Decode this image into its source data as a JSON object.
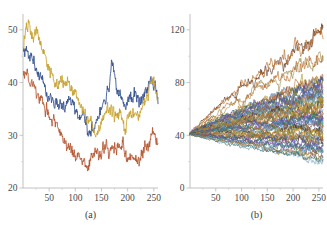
{
  "figure": {
    "background": "#ffffff",
    "axis_color": "#b9b9b9",
    "text_color": "#3a3a3a"
  },
  "chart_data": [
    {
      "type": "line",
      "panel_label": "(a)",
      "title": "",
      "xlabel": "",
      "ylabel": "",
      "xlim": [
        0,
        258
      ],
      "ylim": [
        20,
        53
      ],
      "xticks": [
        50,
        100,
        150,
        200,
        250
      ],
      "xtick_labels": [
        "50",
        "100",
        "150",
        "200",
        "250"
      ],
      "yticks": [
        20,
        30,
        40,
        50
      ],
      "ytick_labels": [
        "20",
        "30",
        "40",
        "50"
      ],
      "grid": false,
      "legend": "none",
      "n_series": 3,
      "series": [
        {
          "name": "path-1",
          "color": "#2F4D8F",
          "x": [
            1,
            5,
            10,
            15,
            20,
            25,
            30,
            35,
            40,
            45,
            50,
            55,
            60,
            65,
            70,
            75,
            80,
            85,
            90,
            95,
            100,
            105,
            110,
            115,
            120,
            125,
            130,
            135,
            140,
            145,
            150,
            155,
            160,
            165,
            170,
            175,
            180,
            185,
            190,
            195,
            200,
            205,
            210,
            215,
            220,
            225,
            230,
            235,
            240,
            245,
            250,
            255,
            258
          ],
          "values": [
            46.0,
            46.8,
            45.2,
            44.6,
            43.4,
            42.6,
            41.4,
            40.5,
            39.8,
            38.6,
            37.2,
            36.6,
            36.2,
            36.4,
            35.4,
            35.8,
            36.0,
            36.6,
            36.2,
            35.6,
            34.6,
            34.0,
            33.6,
            33.2,
            32.0,
            30.4,
            30.2,
            31.4,
            32.6,
            33.8,
            34.6,
            36.8,
            37.0,
            39.2,
            45.2,
            42.0,
            38.8,
            38.0,
            36.8,
            35.6,
            36.4,
            36.2,
            37.4,
            37.8,
            37.2,
            36.6,
            37.6,
            38.4,
            39.6,
            40.8,
            40.4,
            38.0,
            37.2
          ]
        },
        {
          "name": "path-2",
          "color": "#C6A12B",
          "x": [
            1,
            5,
            10,
            15,
            20,
            25,
            30,
            35,
            40,
            45,
            50,
            55,
            60,
            65,
            70,
            75,
            80,
            85,
            90,
            95,
            100,
            105,
            110,
            115,
            120,
            125,
            130,
            135,
            140,
            145,
            150,
            155,
            160,
            165,
            170,
            175,
            180,
            185,
            190,
            195,
            200,
            205,
            210,
            215,
            220,
            225,
            230,
            235,
            240,
            245,
            250,
            255,
            258
          ],
          "values": [
            46.4,
            50.0,
            51.6,
            49.6,
            48.6,
            49.6,
            48.4,
            47.0,
            45.8,
            44.2,
            42.8,
            41.8,
            40.0,
            39.2,
            39.8,
            40.4,
            39.6,
            40.6,
            39.6,
            38.4,
            37.8,
            36.6,
            35.4,
            34.4,
            34.0,
            32.4,
            32.6,
            31.2,
            30.2,
            31.6,
            32.8,
            33.4,
            34.4,
            34.0,
            34.6,
            34.2,
            33.2,
            34.8,
            33.6,
            31.6,
            33.6,
            33.2,
            34.2,
            34.6,
            34.0,
            34.8,
            35.6,
            36.8,
            38.2,
            40.2,
            40.6,
            37.6,
            36.6
          ]
        },
        {
          "name": "path-3",
          "color": "#B5542E",
          "x": [
            1,
            5,
            10,
            15,
            20,
            25,
            30,
            35,
            40,
            45,
            50,
            55,
            60,
            65,
            70,
            75,
            80,
            85,
            90,
            95,
            100,
            105,
            110,
            115,
            120,
            125,
            130,
            135,
            140,
            145,
            150,
            155,
            160,
            165,
            170,
            175,
            180,
            185,
            190,
            195,
            200,
            205,
            210,
            215,
            220,
            225,
            230,
            235,
            240,
            245,
            250,
            255,
            258
          ],
          "values": [
            42.2,
            41.6,
            40.8,
            40.2,
            39.2,
            38.6,
            37.2,
            36.4,
            35.4,
            34.6,
            34.0,
            32.6,
            32.8,
            31.4,
            30.4,
            29.2,
            28.6,
            28.4,
            27.6,
            26.6,
            25.2,
            26.0,
            25.4,
            24.8,
            25.4,
            24.2,
            25.2,
            26.4,
            26.8,
            26.2,
            26.0,
            27.6,
            27.2,
            26.6,
            28.4,
            27.0,
            28.4,
            27.6,
            28.6,
            26.2,
            26.4,
            26.6,
            26.0,
            25.2,
            24.8,
            25.6,
            26.8,
            27.6,
            28.6,
            30.0,
            31.0,
            29.0,
            28.0
          ]
        }
      ]
    },
    {
      "type": "line",
      "panel_label": "(b)",
      "title": "",
      "xlabel": "",
      "ylabel": "",
      "xlim": [
        0,
        258
      ],
      "ylim": [
        0,
        132
      ],
      "xticks": [
        50,
        100,
        150,
        200,
        250
      ],
      "xtick_labels": [
        "50",
        "100",
        "150",
        "200",
        "250"
      ],
      "yticks": [
        0,
        40,
        80,
        120
      ],
      "ytick_labels": [
        "0",
        "40",
        "80",
        "120"
      ],
      "grid": false,
      "legend": "none",
      "n_series": 60,
      "start_value": 41,
      "description": "Sixty simulated random-walk paths all starting near 41 and fanning out; highest path rises to about 120, lowest falls to about 18",
      "envelope": {
        "max_path_end": 118,
        "max_path_peak": 126,
        "min_path_end": 21,
        "bulk_upper": 78,
        "bulk_lower": 25
      },
      "palette": [
        "#5A2D1A",
        "#B5651D",
        "#C0783C",
        "#2F4D8F",
        "#3E6FA8",
        "#4A8FBF",
        "#7FA8C9",
        "#C6A12B",
        "#A8912F",
        "#6B7A3A",
        "#4F6B3A",
        "#7E4B8E",
        "#8E5A3C",
        "#3C6E5A",
        "#9B8A4A",
        "#5E7FA8",
        "#A85B3C",
        "#6A5ACD",
        "#2E7D6B",
        "#B08030"
      ]
    }
  ]
}
